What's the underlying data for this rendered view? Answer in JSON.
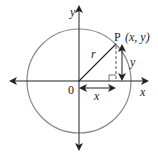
{
  "diagram": {
    "labels": {
      "y_axis": "y",
      "x_axis": "x",
      "origin": "0",
      "radius": "r",
      "point_P": "P",
      "point_coords": "(x, y)",
      "x_segment": "x",
      "y_segment": "y"
    },
    "colors": {
      "circle": "#8a8a8a",
      "axes": "#222222",
      "radius": "#222222",
      "dashed": "#555555"
    }
  }
}
